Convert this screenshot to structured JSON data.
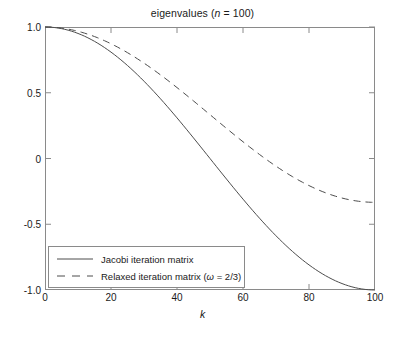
{
  "chart_data": {
    "type": "line",
    "title": "eigenvalues (n = 100)",
    "title_prefix": "eigenvalues (",
    "title_var": "n",
    "title_suffix": " = 100)",
    "xlabel": "k",
    "ylabel": "",
    "xlim": [
      0,
      100
    ],
    "ylim": [
      -1.0,
      1.0
    ],
    "grid": false,
    "legend_position": "lower-left",
    "xticks": [
      0,
      20,
      40,
      60,
      80,
      100
    ],
    "xtick_labels": [
      "0",
      "20",
      "40",
      "60",
      "80",
      "100"
    ],
    "yticks": [
      1.0,
      0.5,
      0,
      -0.5,
      -1.0
    ],
    "ytick_labels": [
      "1.0",
      "0.5",
      "0",
      "-0.5",
      "-1.0"
    ],
    "n": 100,
    "omega": "2/3",
    "series": [
      {
        "name": "Jacobi iteration matrix",
        "style": "solid",
        "color": "#4d4d4d",
        "formula": "cos(k*pi/n)",
        "x": [
          0,
          5,
          10,
          15,
          20,
          25,
          30,
          35,
          40,
          45,
          50,
          55,
          60,
          65,
          70,
          75,
          80,
          85,
          90,
          95,
          100
        ],
        "values": [
          1.0,
          0.988,
          0.951,
          0.891,
          0.809,
          0.707,
          0.588,
          0.454,
          0.309,
          0.156,
          0.0,
          -0.156,
          -0.309,
          -0.454,
          -0.588,
          -0.707,
          -0.809,
          -0.891,
          -0.951,
          -0.988,
          -1.0
        ]
      },
      {
        "name": "Relaxed iteration matrix (ω = 2/3)",
        "name_prefix": "Relaxed iteration matrix (",
        "name_var": "ω",
        "name_suffix": " = 2/3)",
        "style": "dashed",
        "color": "#4d4d4d",
        "formula": "1 - (2/3)*(1 - cos(k*pi/n))",
        "x": [
          0,
          5,
          10,
          15,
          20,
          25,
          30,
          35,
          40,
          45,
          50,
          55,
          60,
          65,
          70,
          75,
          80,
          85,
          90,
          95,
          100
        ],
        "values": [
          1.0,
          0.992,
          0.967,
          0.927,
          0.873,
          0.805,
          0.725,
          0.636,
          0.539,
          0.437,
          0.333,
          0.229,
          0.127,
          0.031,
          -0.059,
          -0.138,
          -0.206,
          -0.261,
          -0.301,
          -0.325,
          -0.333
        ]
      }
    ]
  },
  "axes": {
    "ytick_labels": [
      "1.0",
      "0.5",
      "0",
      "-0.5",
      "-1.0"
    ],
    "xtick_labels": [
      "0",
      "20",
      "40",
      "60",
      "80",
      "100"
    ],
    "xlabel": "k"
  },
  "legend": {
    "items": [
      {
        "label": "Jacobi iteration matrix",
        "style": "solid"
      },
      {
        "label": "Relaxed iteration matrix (ω = 2/3)",
        "style": "dashed"
      }
    ]
  },
  "colors": {
    "axis": "#8a8a8a",
    "curve": "#4d4d4d",
    "text": "#1a1a1a",
    "background": "#ffffff"
  }
}
